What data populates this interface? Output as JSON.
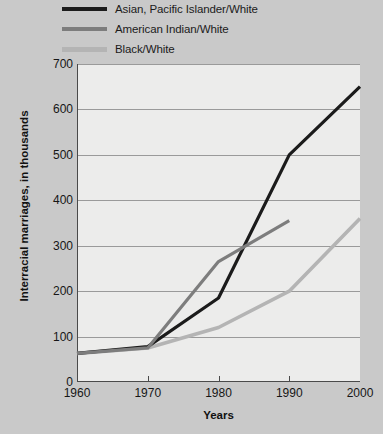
{
  "chart_data": {
    "type": "line",
    "title": "",
    "xlabel": "Years",
    "ylabel": "Interracial marriages, in thousands",
    "x": [
      1960,
      1970,
      1980,
      1990,
      2000
    ],
    "xtick_labels": [
      "1960",
      "1970",
      "1980",
      "1990",
      "2000"
    ],
    "ytick_labels": [
      "0",
      "100",
      "200",
      "300",
      "400",
      "500",
      "600",
      "700"
    ],
    "xlim": [
      1960,
      2000
    ],
    "ylim": [
      0,
      700
    ],
    "ytick_step": 100,
    "grid": "horizontal",
    "legend_position": "top-left",
    "series": [
      {
        "name": "Asian, Pacific Islander/White",
        "color": "#1b1b1b",
        "width": 3.2,
        "x": [
          1960,
          1970,
          1980,
          1990,
          2000
        ],
        "values": [
          63,
          78,
          185,
          500,
          650
        ]
      },
      {
        "name": "American Indian/White",
        "color": "#7d7d7d",
        "width": 3.2,
        "x": [
          1960,
          1970,
          1980,
          1990
        ],
        "values": [
          63,
          75,
          265,
          355
        ]
      },
      {
        "name": "Black/White",
        "color": "#b4b4b4",
        "width": 3.6,
        "x": [
          1960,
          1970,
          1980,
          1990,
          2000
        ],
        "values": [
          63,
          75,
          120,
          200,
          360
        ]
      }
    ]
  },
  "legend": {
    "items": [
      {
        "label": "Asian, Pacific Islander/White"
      },
      {
        "label": "American Indian/White"
      },
      {
        "label": "Black/White"
      }
    ]
  },
  "axes": {
    "y_title": "Interracial marriages, in thousands",
    "x_title": "Years"
  },
  "colors": {
    "page_background": "#c9c9c9",
    "plot_background": "#ececeb",
    "axis": "#4a4a4a",
    "gridline": "#9a9a9a",
    "text": "#161616"
  }
}
